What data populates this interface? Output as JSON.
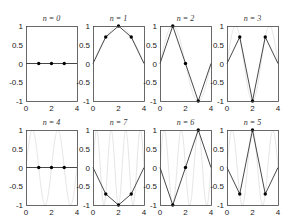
{
  "chart_data": {
    "type": "line",
    "layout": {
      "rows": 2,
      "cols": 4
    },
    "xlim": [
      0,
      4
    ],
    "ylim": [
      -1,
      1
    ],
    "xticks": [
      "0",
      "2",
      "4"
    ],
    "yticks": [
      "1",
      "0.5",
      "0",
      "-0.5",
      "-1"
    ],
    "grid": false,
    "background_curve": "sin(n*pi*x/4) continuous, light gray",
    "sample_x": [
      0,
      1,
      2,
      3,
      4
    ],
    "marker_x": [
      1,
      2,
      3
    ],
    "panels": [
      {
        "title": "n = 0",
        "n": 0,
        "values": [
          0,
          0,
          0,
          0,
          0
        ]
      },
      {
        "title": "n = 1",
        "n": 1,
        "values": [
          0,
          0.707,
          1,
          0.707,
          0
        ]
      },
      {
        "title": "n = 2",
        "n": 2,
        "values": [
          0,
          1,
          0,
          -1,
          0
        ]
      },
      {
        "title": "n = 3",
        "n": 3,
        "values": [
          0,
          0.707,
          -1,
          0.707,
          0
        ]
      },
      {
        "title": "n = 4",
        "n": 4,
        "values": [
          0,
          0,
          0,
          0,
          0
        ]
      },
      {
        "title": "n = 7",
        "n": 7,
        "values": [
          0,
          -0.707,
          -1,
          -0.707,
          0
        ]
      },
      {
        "title": "n = 6",
        "n": 6,
        "values": [
          0,
          -1,
          0,
          1,
          0
        ]
      },
      {
        "title": "n = 5",
        "n": 5,
        "values": [
          0,
          -0.707,
          1,
          -0.707,
          0
        ]
      }
    ]
  },
  "colors": {
    "axis": "#444444",
    "line": "#333333",
    "marker": "#000000",
    "background_curve": "#d8d8d8"
  }
}
